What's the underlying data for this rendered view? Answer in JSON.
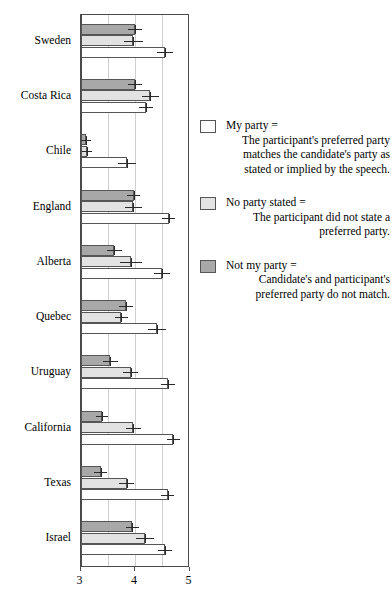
{
  "chart_data": {
    "type": "bar",
    "orientation": "horizontal",
    "title": "",
    "xlabel": "",
    "ylabel": "",
    "xlim": [
      3,
      5
    ],
    "xticks": [
      3,
      4,
      5
    ],
    "xtick_labels": [
      "3",
      "4",
      "5"
    ],
    "gridlines": [
      3.5,
      4.0,
      4.5
    ],
    "grid": true,
    "legend_position": "right",
    "categories": [
      "Sweden",
      "Costa Rica",
      "Chile",
      "England",
      "Alberta",
      "Quebec",
      "Uruguay",
      "California",
      "Texas",
      "Israel"
    ],
    "series": [
      {
        "name": "Not my party",
        "color": "#a8a8a8",
        "values": [
          4.0,
          4.0,
          3.1,
          3.98,
          3.62,
          3.83,
          3.55,
          3.4,
          3.37,
          3.95
        ],
        "errors": [
          0.13,
          0.12,
          0.09,
          0.12,
          0.14,
          0.13,
          0.13,
          0.11,
          0.12,
          0.12
        ]
      },
      {
        "name": "No party stated",
        "color": "#e2e2e2",
        "values": [
          3.97,
          4.28,
          3.12,
          3.97,
          3.92,
          3.75,
          3.92,
          3.97,
          3.85,
          4.18
        ],
        "errors": [
          0.18,
          0.16,
          0.1,
          0.16,
          0.2,
          0.12,
          0.14,
          0.14,
          0.14,
          0.16
        ]
      },
      {
        "name": "My party",
        "color": "#ffffff",
        "values": [
          4.55,
          4.2,
          3.85,
          4.62,
          4.5,
          4.4,
          4.6,
          4.7,
          4.6,
          4.55
        ],
        "errors": [
          0.15,
          0.13,
          0.17,
          0.12,
          0.15,
          0.16,
          0.13,
          0.12,
          0.12,
          0.13
        ]
      }
    ]
  },
  "legend": {
    "entries": [
      {
        "swatch": "my",
        "title": "My party =",
        "description": "The participant's preferred party matches the candidate's party as stated or implied by the speech."
      },
      {
        "swatch": "nostate",
        "title": "No party stated =",
        "description": "The participant did not state a preferred party."
      },
      {
        "swatch": "notmy",
        "title": "Not my party =",
        "description": "Candidate's and participant's preferred party do not match."
      }
    ]
  }
}
